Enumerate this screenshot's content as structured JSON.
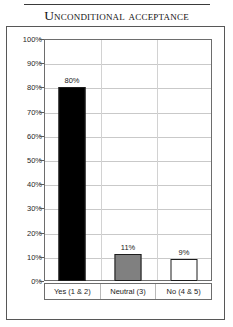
{
  "chart_data": {
    "type": "bar",
    "title": "Unconditional acceptance",
    "categories": [
      "Yes (1 & 2)",
      "Neutral (3)",
      "No (4 & 5)"
    ],
    "values": [
      80,
      11,
      9
    ],
    "value_labels": [
      "80%",
      "11%",
      "9%"
    ],
    "bar_colors": [
      "#000000",
      "#808080",
      "#ffffff"
    ],
    "bar_border_color": "#1c1c1c",
    "xlabel": "",
    "ylabel": "",
    "ylim": [
      0,
      100
    ],
    "ytick_labels": [
      "100%",
      "90%",
      "80%",
      "70%",
      "60%",
      "50%",
      "40%",
      "30%",
      "20%",
      "10%",
      "0%"
    ],
    "ytick_values": [
      100,
      90,
      80,
      70,
      60,
      50,
      40,
      30,
      20,
      10,
      0
    ],
    "grid": true,
    "legend": "none"
  }
}
